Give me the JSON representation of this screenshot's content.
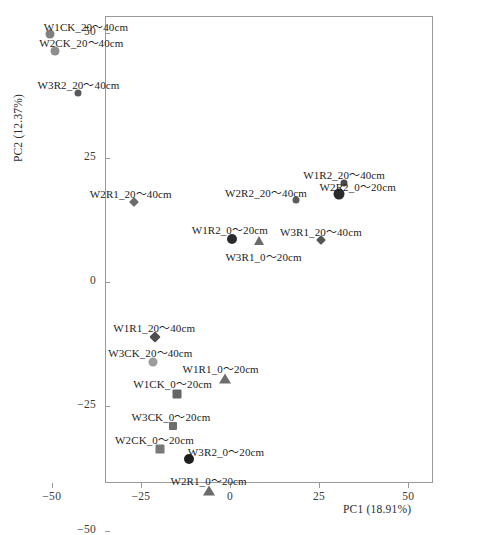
{
  "chart_data": {
    "type": "scatter",
    "title": "",
    "xlabel": "PC1 (18.91%)",
    "ylabel": "PC2 (12.37%)",
    "xlim": [
      -58,
      34
    ],
    "ylim": [
      -56,
      53
    ],
    "xticks": [
      -50,
      -25,
      0,
      25,
      50
    ],
    "xticklabels": [
      "−50",
      "−25",
      "0",
      "25",
      "50"
    ],
    "yticks": [
      50,
      25,
      0,
      -25,
      -50
    ],
    "yticklabels": [
      "50",
      "25",
      "0",
      "−25",
      "−50"
    ],
    "grid": false,
    "legend": "none",
    "points": [
      {
        "label": "W1CK_20～40cm",
        "x": -50.5,
        "y": 49.8,
        "marker": "circle",
        "color": "#808080",
        "size": 9,
        "label_dx": 36,
        "label_dy": -16
      },
      {
        "label": "W2CK_20～40cm",
        "x": -49.0,
        "y": 46.5,
        "marker": "circle",
        "color": "#8e8e8e",
        "size": 9,
        "label_dx": 26,
        "label_dy": -17
      },
      {
        "label": "W3R2_20～40cm",
        "x": -42.5,
        "y": 38.0,
        "marker": "circle",
        "color": "#595959",
        "size": 7,
        "label_dx": 0,
        "label_dy": -17
      },
      {
        "label": "W2R1_20～40cm",
        "x": -27.0,
        "y": 16.0,
        "marker": "diamond",
        "color": "#6b6b6b",
        "size": 7,
        "label_dx": -3,
        "label_dy": -17
      },
      {
        "label": "W1R2_20～40cm",
        "x": 32.0,
        "y": 20.0,
        "marker": "circle",
        "color": "#4a4a4a",
        "size": 7,
        "label_dx": 0,
        "label_dy": -17
      },
      {
        "label": "W2R2_0～20cm",
        "x": 30.5,
        "y": 17.6,
        "marker": "circle",
        "color": "#2b2b2b",
        "size": 11,
        "label_dx": 19,
        "label_dy": -16
      },
      {
        "label": "W2R2_20～40cm",
        "x": 18.5,
        "y": 16.5,
        "marker": "circle",
        "color": "#5c5c5c",
        "size": 7,
        "label_dx": -30,
        "label_dy": -16
      },
      {
        "label": "W3R1_20～40cm",
        "x": 25.5,
        "y": 8.4,
        "marker": "diamond",
        "color": "#555555",
        "size": 7,
        "label_dx": 0,
        "label_dy": -17
      },
      {
        "label": "W1R2_0～20cm",
        "x": 0.5,
        "y": 8.6,
        "marker": "circle",
        "color": "#2b2b2b",
        "size": 10,
        "label_dx": -2,
        "label_dy": -18
      },
      {
        "label": "W3R1_0～20cm",
        "x": 8.0,
        "y": 8.2,
        "marker": "triangle",
        "color": "#6b6b6b",
        "size": 11,
        "label_dx": 5,
        "label_dy": 7
      },
      {
        "label": "W1R1_20～40cm",
        "x": -21.0,
        "y": -11.0,
        "marker": "diamond",
        "color": "#4f4f4f",
        "size": 8,
        "label_dx": -1,
        "label_dy": -18
      },
      {
        "label": "W3CK_20～40cm",
        "x": -21.5,
        "y": -16.0,
        "marker": "circle",
        "color": "#9b9b9b",
        "size": 9,
        "label_dx": -3,
        "label_dy": -18
      },
      {
        "label": "W1R1_0～20cm",
        "x": -1.5,
        "y": -19.5,
        "marker": "triangle",
        "color": "#6e6e6e",
        "size": 12,
        "label_dx": -4,
        "label_dy": -19
      },
      {
        "label": "W1CK_0～20cm",
        "x": -15.0,
        "y": -22.5,
        "marker": "square",
        "color": "#656565",
        "size": 9,
        "label_dx": -4,
        "label_dy": -19
      },
      {
        "label": "W3CK_0～20cm",
        "x": -16.0,
        "y": -29.0,
        "marker": "square",
        "color": "#6d6d6d",
        "size": 8,
        "label_dx": -2,
        "label_dy": -18
      },
      {
        "label": "W2CK_0～20cm",
        "x": -19.5,
        "y": -33.5,
        "marker": "square",
        "color": "#787878",
        "size": 9,
        "label_dx": -6,
        "label_dy": -18
      },
      {
        "label": "W3R2_0～20cm",
        "x": -11.5,
        "y": -35.5,
        "marker": "circle",
        "color": "#1f1f1f",
        "size": 10,
        "label_dx": 37,
        "label_dy": -16
      },
      {
        "label": "W2R1_0～20cm",
        "x": -6.0,
        "y": -42.0,
        "marker": "triangle",
        "color": "#6b6b6b",
        "size": 12,
        "label_dx": 0,
        "label_dy": -19
      }
    ]
  }
}
